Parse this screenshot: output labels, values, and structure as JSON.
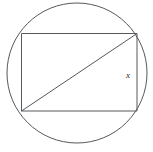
{
  "figure": {
    "background_color": "#ffffff",
    "stroke_color": "#55585c",
    "label_color": "#2e2e2e",
    "circle": {
      "name": "circumscribed-circle",
      "center_x": 77,
      "center_y": 73,
      "radius": 70
    },
    "rectangle": {
      "name": "inscribed-rectangle",
      "left": 21.5,
      "top": 33.5,
      "right": 137,
      "bottom": 111,
      "width": 115.5,
      "height": 77.5
    },
    "diagonal": {
      "name": "rectangle-diagonal",
      "x1": 21.5,
      "y1": 111,
      "x2": 137,
      "y2": 33.5
    },
    "labels": [
      {
        "id": "side-label-x",
        "text": "x",
        "x": 128,
        "y": 76,
        "describes": "right-side-length"
      }
    ]
  }
}
